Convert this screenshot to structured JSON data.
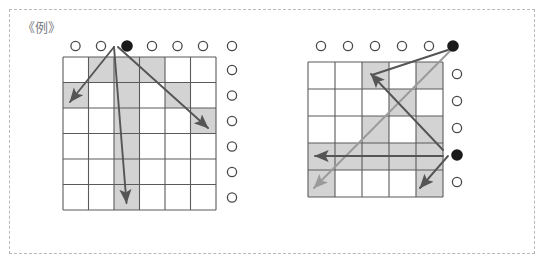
{
  "figure": {
    "label": "《例》",
    "frame_style": "dashed",
    "background_color": "#ffffff",
    "frame_color": "#b9b9bd",
    "grid_line_color": "#5a5a5a",
    "shade_color": "#d3d3d3",
    "dot_filled_color": "#1a1a1a",
    "dot_open_color": "#ffffff",
    "dot_outline_color": "#4a4a4a",
    "arrow_dark_color": "#555555",
    "arrow_light_color": "#9a9a9a"
  },
  "panels": [
    {
      "name": "left-panel",
      "grid": {
        "cols": 6,
        "rows": 6,
        "origin_x": 63,
        "origin_y": 57,
        "cell": 25.5
      },
      "shaded_cells": [
        [
          0,
          1
        ],
        [
          0,
          2
        ],
        [
          0,
          3
        ],
        [
          1,
          0
        ],
        [
          1,
          2
        ],
        [
          1,
          4
        ],
        [
          2,
          2
        ],
        [
          3,
          2
        ],
        [
          4,
          2
        ],
        [
          5,
          2
        ]
      ],
      "top_dots": [
        {
          "col": 0,
          "filled": false
        },
        {
          "col": 1,
          "filled": false
        },
        {
          "col": 2,
          "filled": true
        },
        {
          "col": 3,
          "filled": false
        },
        {
          "col": 4,
          "filled": false
        },
        {
          "col": 5,
          "filled": false
        },
        {
          "col": 6,
          "filled": false
        }
      ],
      "right_dots": [
        {
          "row": 0,
          "filled": false
        },
        {
          "row": 1,
          "filled": false
        },
        {
          "row": 2,
          "filled": false
        },
        {
          "row": 3,
          "filled": false
        },
        {
          "row": 4,
          "filled": false
        },
        {
          "row": 5,
          "filled": false
        }
      ],
      "arrows": [
        {
          "name": "diagonal-down-left",
          "from_x": 114,
          "from_y": 46,
          "to_x": 68,
          "to_y": 103,
          "color": "dark"
        },
        {
          "name": "vertical-down",
          "from_x": 114,
          "from_y": 46,
          "to_x": 114,
          "to_y": 211,
          "color": "dark"
        },
        {
          "name": "diagonal-down-right",
          "from_x": 114,
          "from_y": 46,
          "to_x": 211,
          "to_y": 133,
          "color": "dark"
        }
      ]
    },
    {
      "name": "right-panel",
      "grid": {
        "cols": 5,
        "rows": 5,
        "origin_x": 308,
        "origin_y": 62,
        "cell": 27
      },
      "shaded_cells": [
        [
          0,
          2
        ],
        [
          0,
          4
        ],
        [
          1,
          3
        ],
        [
          2,
          2
        ],
        [
          2,
          4
        ],
        [
          3,
          0
        ],
        [
          3,
          1
        ],
        [
          3,
          2
        ],
        [
          3,
          3
        ],
        [
          3,
          4
        ],
        [
          4,
          0
        ],
        [
          4,
          4
        ]
      ],
      "top_dots": [
        {
          "col": 0,
          "filled": false
        },
        {
          "col": 1,
          "filled": false
        },
        {
          "col": 2,
          "filled": false
        },
        {
          "col": 3,
          "filled": false
        },
        {
          "col": 4,
          "filled": false
        },
        {
          "col": 5,
          "filled": true
        }
      ],
      "right_dots": [
        {
          "row": 0,
          "filled": false
        },
        {
          "row": 1,
          "filled": false
        },
        {
          "row": 2,
          "filled": false
        },
        {
          "row": 3,
          "filled": true
        },
        {
          "row": 4,
          "filled": false
        }
      ],
      "arrows": [
        {
          "name": "diagonal-down-left-from-top",
          "from_x": 453,
          "from_y": 46,
          "to_x": 359,
          "to_y": 140,
          "color": "dark"
        },
        {
          "name": "diagonal-up-left-to-row0",
          "from_x": 443,
          "from_y": 152,
          "to_x": 369,
          "to_y": 72,
          "color": "dark"
        },
        {
          "name": "arrow-left-row3",
          "from_x": 443,
          "from_y": 152,
          "to_x": 313,
          "to_y": 152,
          "color": "dark"
        },
        {
          "name": "diagonal-down-left-light",
          "from_x": 443,
          "from_y": 152,
          "to_x": 313,
          "to_y": 192,
          "color": "light"
        },
        {
          "name": "diagonal-down-left-lower",
          "from_x": 443,
          "from_y": 152,
          "to_x": 418,
          "to_y": 192,
          "color": "dark"
        }
      ]
    }
  ]
}
